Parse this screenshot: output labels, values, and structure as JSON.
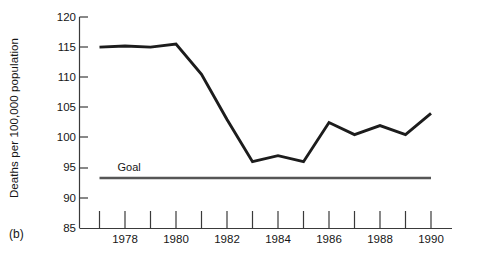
{
  "figure": {
    "panel_label": "(b)",
    "ylabel": "Deaths per 100,000 population",
    "goal_label": "Goal"
  },
  "chart_data": {
    "type": "line",
    "title": "",
    "xlabel": "",
    "ylabel": "Deaths per 100,000 population",
    "grid": false,
    "legend": "none",
    "xlim": [
      1977,
      1990
    ],
    "ylim": [
      85,
      120
    ],
    "ytick_labels": [
      "120",
      "115",
      "110",
      "105",
      "100",
      "95",
      "90",
      "85"
    ],
    "ytick_values": [
      120,
      115,
      110,
      105,
      100,
      95,
      90,
      85
    ],
    "xtick_values": [
      1977,
      1978,
      1979,
      1980,
      1981,
      1982,
      1983,
      1984,
      1985,
      1986,
      1987,
      1988,
      1989,
      1990
    ],
    "xtick_labels": [
      "",
      "1978",
      "",
      "1980",
      "",
      "1982",
      "",
      "1984",
      "",
      "1986",
      "",
      "1988",
      "",
      "1990"
    ],
    "x": [
      1977,
      1978,
      1979,
      1980,
      1981,
      1982,
      1983,
      1984,
      1985,
      1986,
      1987,
      1988,
      1989,
      1990
    ],
    "series": [
      {
        "name": "Death rate",
        "color": "#1c1c1c",
        "values": [
          115.0,
          115.2,
          115.0,
          115.5,
          110.5,
          103.0,
          96.0,
          97.0,
          96.0,
          102.5,
          100.5,
          102.0,
          100.5,
          104.0
        ]
      },
      {
        "name": "Goal",
        "color": "#565656",
        "values": [
          93.3,
          93.3,
          93.3,
          93.3,
          93.3,
          93.3,
          93.3,
          93.3,
          93.3,
          93.3,
          93.3,
          93.3,
          93.3,
          93.3
        ]
      }
    ],
    "annotations": [
      {
        "text": "Goal",
        "x": 1978.1,
        "y": 94.8
      }
    ]
  }
}
